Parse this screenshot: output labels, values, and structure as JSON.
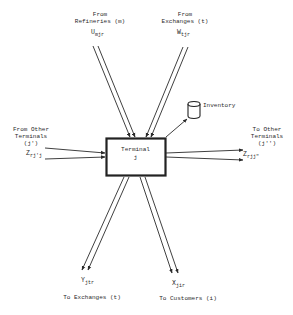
{
  "diagram": {
    "node": {
      "title": "Terminal",
      "index": "j"
    },
    "inventory": {
      "label": "Inventory"
    },
    "inputs": {
      "refineries": {
        "label_line1": "From",
        "label_line2": "Refineries (m)",
        "var_main": "U",
        "var_sub": "mjr"
      },
      "exchanges": {
        "label_line1": "From",
        "label_line2": "Exchanges (t)",
        "var_main": "W",
        "var_sub": "tjr"
      },
      "other_terminals": {
        "label_line1": "From Other",
        "label_line2": "Terminals",
        "label_line3": "(j')",
        "var_main": "Z",
        "var_sub": "rj'j"
      }
    },
    "outputs": {
      "other_terminals": {
        "label_line1": "To Other",
        "label_line2": "Terminals",
        "label_line3": "(j'')",
        "var_main": "Z",
        "var_sub": "rjj\""
      },
      "exchanges": {
        "label": "To Exchanges (t)",
        "var_main": "Y",
        "var_sub": "jtr"
      },
      "customers": {
        "label": "To Customers (i)",
        "var_main": "X",
        "var_sub": "jir"
      }
    },
    "colors": {
      "ink": "#2a2a2a",
      "background": "#ffffff"
    }
  }
}
